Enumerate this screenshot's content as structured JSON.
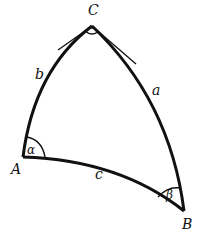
{
  "diagram": {
    "type": "spherical-triangle",
    "vertices": {
      "A": "A",
      "B": "B",
      "C": "C"
    },
    "sides": {
      "a": "a",
      "b": "b",
      "c": "c"
    },
    "angles": {
      "alpha": "α",
      "beta": "β",
      "gamma_right_angle_marker": "right-angle"
    },
    "stroke_color": "#111111",
    "background_color": "#ffffff"
  }
}
